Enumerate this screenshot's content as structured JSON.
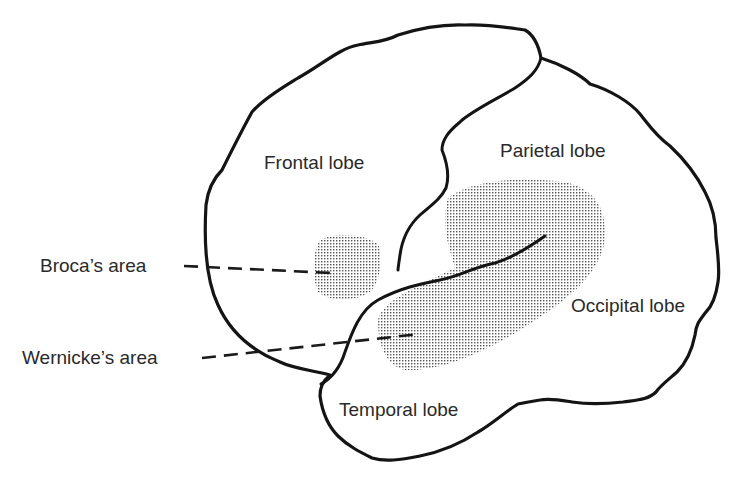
{
  "diagram": {
    "lobes": [
      {
        "id": "frontal",
        "label": "Frontal lobe"
      },
      {
        "id": "parietal",
        "label": "Parietal lobe"
      },
      {
        "id": "occipital",
        "label": "Occipital lobe"
      },
      {
        "id": "temporal",
        "label": "Temporal lobe"
      }
    ],
    "areas": [
      {
        "id": "broca",
        "label": "Broca’s area",
        "fill": "stippled"
      },
      {
        "id": "wernicke",
        "label": "Wernicke’s area",
        "fill": "stippled"
      }
    ],
    "colors": {
      "stroke": "#141414",
      "text": "#2a2a2a",
      "stipple": "#555555",
      "background": "#ffffff"
    }
  }
}
